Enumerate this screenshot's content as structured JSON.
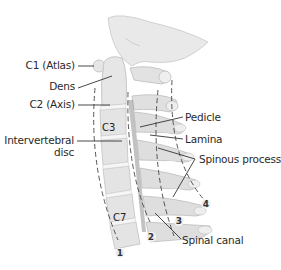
{
  "diagram": {
    "labels_left": {
      "c1": "C1 (Atlas)",
      "dens": "Dens",
      "c2": "C2 (Axis)",
      "intervertebral_disc_line1": "Intervertebral",
      "intervertebral_disc_line2": "disc"
    },
    "labels_right": {
      "pedicle": "Pedicle",
      "lamina": "Lamina",
      "spinous_process": "Spinous process",
      "spinal_canal": "Spinal canal"
    },
    "vertebra_labels": {
      "c3": "C3",
      "c7": "C7"
    },
    "line_markers": [
      "1",
      "2",
      "3",
      "4"
    ],
    "colors": {
      "bone": "#dcdcdc",
      "bone_light": "#ececec",
      "bone_edge": "#bdbdbd",
      "disc": "#f4f4f4",
      "canal_dark": "#8a8a8a",
      "line": "#333333",
      "text": "#2a2a2a"
    }
  }
}
